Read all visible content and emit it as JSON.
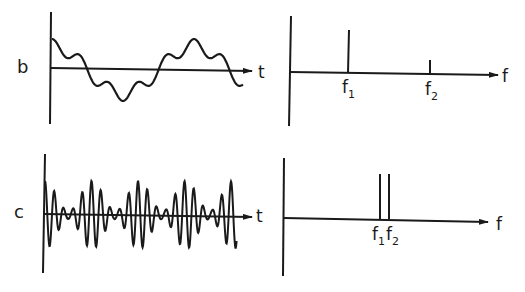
{
  "panels": {
    "b": {
      "row_label": "b",
      "time": {
        "axis_label": "t",
        "description": "Fundamental sine wave f1 with small higher-frequency ripple f2 superposed"
      },
      "spectrum": {
        "axis_label": "f",
        "lines": [
          {
            "label": "f",
            "sub": "1",
            "relative_amplitude": 1.0
          },
          {
            "label": "f",
            "sub": "2",
            "relative_amplitude": 0.35
          }
        ]
      }
    },
    "c": {
      "row_label": "c",
      "time": {
        "axis_label": "t",
        "description": "Beat signal: two close frequencies f1 and f2 producing amplitude-modulated bursts"
      },
      "spectrum": {
        "axis_label": "f",
        "lines": [
          {
            "label": "f",
            "sub": "1",
            "relative_amplitude": 1.0
          },
          {
            "label": "f",
            "sub": "2",
            "relative_amplitude": 1.0
          }
        ]
      }
    }
  },
  "colors": {
    "ink": "#1a1a1a",
    "background": "#ffffff"
  }
}
